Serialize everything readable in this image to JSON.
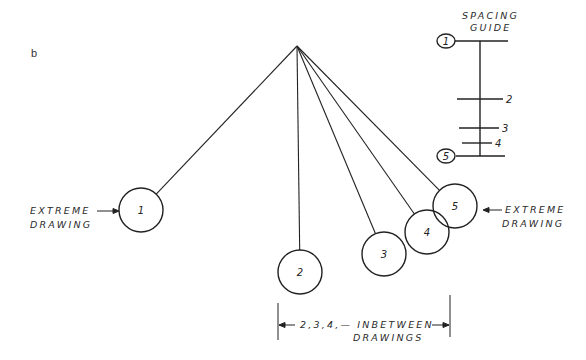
{
  "panel_label": "b",
  "spacing_guide": {
    "title_line1": "SPACING",
    "title_line2": "GUIDE",
    "marks": [
      {
        "label": "1",
        "y": 41,
        "x1": 455,
        "x2": 508,
        "circled": true
      },
      {
        "label": "2",
        "y": 99,
        "x1": 457,
        "x2": 503,
        "circled": false
      },
      {
        "label": "3",
        "y": 128,
        "x1": 459,
        "x2": 499,
        "circled": false
      },
      {
        "label": "4",
        "y": 143,
        "x1": 462,
        "x2": 492,
        "circled": false
      },
      {
        "label": "5",
        "y": 156,
        "x1": 456,
        "x2": 505,
        "circled": true
      }
    ]
  },
  "pendulum": {
    "pivot": {
      "x": 297,
      "y": 46
    },
    "balls": [
      {
        "label": "1",
        "cx": 141,
        "cy": 210,
        "r": 22
      },
      {
        "label": "2",
        "cx": 300,
        "cy": 272,
        "r": 22
      },
      {
        "label": "3",
        "cx": 384,
        "cy": 254,
        "r": 22
      },
      {
        "label": "4",
        "cx": 427,
        "cy": 232,
        "r": 22
      },
      {
        "label": "5",
        "cx": 455,
        "cy": 206,
        "r": 22
      }
    ]
  },
  "annotations": {
    "left_extreme_line1": "EXTREME",
    "left_extreme_line2": "DRAWING",
    "right_extreme_line1": "EXTREME",
    "right_extreme_line2": "DRAWING",
    "inbetween_line1": "2,3,4,— INBETWEEN",
    "inbetween_line2": "DRAWINGS"
  },
  "colors": {
    "ink": "#222222",
    "background": "#ffffff"
  }
}
